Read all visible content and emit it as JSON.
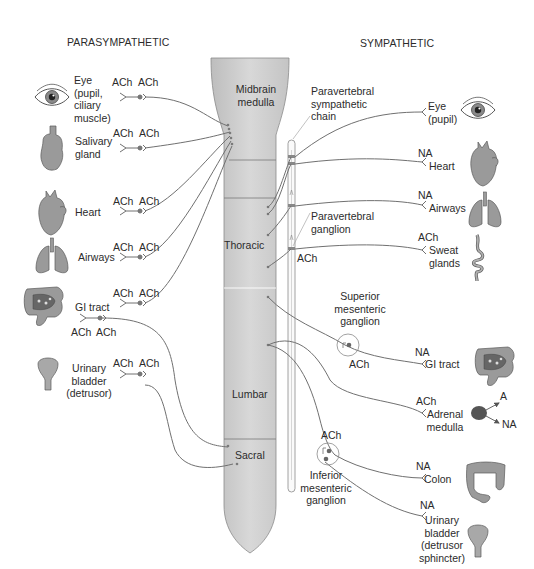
{
  "headers": {
    "parasympathetic": "PARASYMPATHETIC",
    "sympathetic": "SYMPATHETIC"
  },
  "cord": {
    "segments": [
      "Midbrain\nmedulla",
      "Thoracic",
      "Lumbar",
      "Sacral"
    ],
    "midbrain_1": "Midbrain",
    "midbrain_2": "medulla",
    "thoracic": "Thoracic",
    "lumbar": "Lumbar",
    "sacral": "Sacral"
  },
  "structures": {
    "chain_1": "Paravertebral",
    "chain_2": "sympathetic",
    "chain_3": "chain",
    "pv_ganglion_1": "Paravertebral",
    "pv_ganglion_2": "ganglion",
    "pv_ganglion_nt": "ACh",
    "sup_mes_1": "Superior",
    "sup_mes_2": "mesenteric",
    "sup_mes_3": "ganglion",
    "sup_mes_nt": "ACh",
    "inf_mes_nt": "ACh",
    "inf_mes_1": "Inferior",
    "inf_mes_2": "mesenteric",
    "inf_mes_3": "ganglion"
  },
  "parasympathetic": [
    {
      "organ": "Eye (pupil, ciliary muscle)",
      "lines": [
        "Eye",
        "(pupil,",
        "ciliary",
        "muscle)"
      ],
      "pre": "ACh",
      "post": "ACh",
      "icon": "eye-icon"
    },
    {
      "organ": "Salivary gland",
      "lines": [
        "Salivary",
        "gland"
      ],
      "pre": "ACh",
      "post": "ACh",
      "icon": "salivary-gland-icon"
    },
    {
      "organ": "Heart",
      "lines": [
        "Heart"
      ],
      "pre": "ACh",
      "post": "ACh",
      "icon": "heart-icon"
    },
    {
      "organ": "Airways",
      "lines": [
        "Airways"
      ],
      "pre": "ACh",
      "post": "ACh",
      "icon": "lungs-icon"
    },
    {
      "organ": "GI tract",
      "lines": [
        "GI tract"
      ],
      "pre": "ACh",
      "post": "ACh",
      "icon": "intestine-icon",
      "sacral_pre": "ACh",
      "sacral_post": "ACh"
    },
    {
      "organ": "Urinary bladder (detrusor)",
      "lines": [
        "Urinary",
        "bladder",
        "(detrusor)"
      ],
      "pre": "ACh",
      "post": "ACh",
      "icon": "bladder-icon"
    }
  ],
  "sympathetic": [
    {
      "organ": "Eye (pupil)",
      "lines": [
        "Eye",
        "(pupil)"
      ],
      "nt": "",
      "icon": "eye-icon"
    },
    {
      "organ": "Heart",
      "lines": [
        "Heart"
      ],
      "nt": "NA",
      "icon": "heart-icon"
    },
    {
      "organ": "Airways",
      "lines": [
        "Airways"
      ],
      "nt": "NA",
      "icon": "lungs-icon"
    },
    {
      "organ": "Sweat glands",
      "lines": [
        "Sweat",
        "glands"
      ],
      "nt": "ACh",
      "icon": "sweat-gland-icon"
    },
    {
      "organ": "GI tract",
      "lines": [
        "GI tract"
      ],
      "nt": "NA",
      "icon": "intestine-icon"
    },
    {
      "organ": "Adrenal medulla",
      "lines": [
        "Adrenal",
        "medulla"
      ],
      "nt": "ACh",
      "icon": "adrenal-icon",
      "outputs": [
        "A",
        "NA"
      ]
    },
    {
      "organ": "Colon",
      "lines": [
        "Colon"
      ],
      "nt": "NA",
      "icon": "colon-icon"
    },
    {
      "organ": "Urinary bladder (detrusor sphincter)",
      "lines": [
        "Urinary",
        "bladder",
        "(detrusor",
        "sphincter)"
      ],
      "nt": "NA",
      "icon": "bladder-icon"
    }
  ],
  "colors": {
    "cord_fill": "#cfcfcf",
    "organ_fill": "#9a9a9a",
    "nerve": "#6e6e6e",
    "text": "#2b2b2b"
  }
}
